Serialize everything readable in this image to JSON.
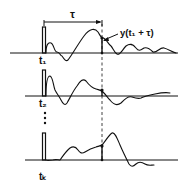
{
  "diagram": {
    "tau_label": "τ",
    "sample_label": "y(t₁ + τ)",
    "traces": [
      {
        "label": "t₁",
        "sub": "1"
      },
      {
        "label": "t₂",
        "sub": "2"
      },
      {
        "label": "tₖ",
        "sub": "k"
      }
    ],
    "ellipsis": "⋮",
    "colors": {
      "ink": "#111111",
      "background": "#ffffff"
    }
  }
}
